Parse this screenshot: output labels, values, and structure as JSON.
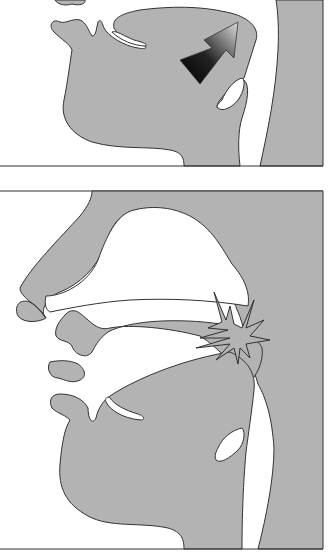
{
  "figure": {
    "type": "vocal tract sagittal cross-sections",
    "panels": [
      {
        "id": "top",
        "description": "Mouth/throat cross-section with arrow indicating tongue-back raising toward velum",
        "marker": "gradient-arrow-icon"
      },
      {
        "id": "bottom",
        "description": "Full vocal tract cross-section with burst indicating velar closure release",
        "marker": "burst-icon"
      }
    ],
    "colors": {
      "tissue": "#b3b3b3",
      "outline": "#333333",
      "background": "#ffffff",
      "arrow_dark": "#000000",
      "arrow_light": "#d8d8d8"
    }
  }
}
